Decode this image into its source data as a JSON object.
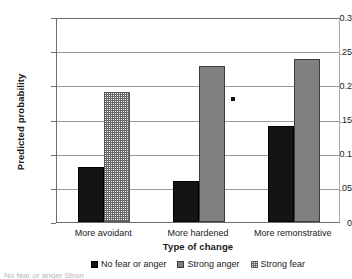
{
  "chart_data": {
    "type": "bar",
    "title": "",
    "xlabel": "Type of change",
    "ylabel": "Predicted probability",
    "categories": [
      "More avoidant",
      "More hardened",
      "More remonstrative"
    ],
    "series": [
      {
        "name": "No fear or anger",
        "color": "#141414",
        "pattern": "solid",
        "values": [
          0.08,
          0.06,
          0.14
        ]
      },
      {
        "name": "Strong anger",
        "color": "#808080",
        "pattern": "solid",
        "values": [
          null,
          0.228,
          0.238
        ]
      },
      {
        "name": "Strong fear",
        "color": "#e9e9e9",
        "pattern": "dotted",
        "values": [
          0.19,
          null,
          null
        ]
      }
    ],
    "ylim": [
      0,
      0.3
    ],
    "ytick_labels": [
      "0.3",
      "0.25",
      "0.2",
      "0.15",
      "0.1",
      "0.05",
      "0"
    ],
    "ytick_values": [
      0.3,
      0.25,
      0.2,
      0.15,
      0.1,
      0.05,
      0
    ],
    "grid": true,
    "legend_position": "bottom",
    "annotations": [
      {
        "name": "lone-point-marker",
        "type": "point",
        "value": 0.18,
        "x_between": [
          "More hardened",
          "More remonstrative"
        ]
      }
    ]
  },
  "caption_sliver": "No fear or anger   Stron"
}
